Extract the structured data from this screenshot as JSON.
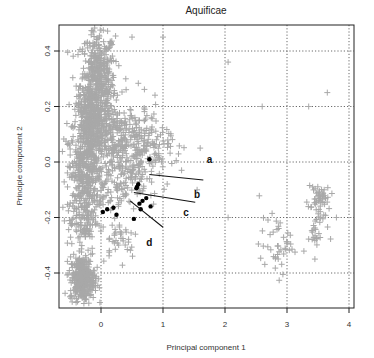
{
  "chart_data": {
    "type": "scatter",
    "title": "Aquificae",
    "xlabel": "Principal component 1",
    "ylabel": "Principle component 2",
    "xlim": [
      -0.65,
      4.05
    ],
    "ylim": [
      -0.52,
      0.5
    ],
    "xticks": [
      0,
      1,
      2,
      3,
      4
    ],
    "yticks": [
      -0.4,
      -0.2,
      0.0,
      0.2,
      0.4
    ],
    "xtick_labels": [
      "0",
      "1",
      "2",
      "3",
      "4"
    ],
    "ytick_labels": [
      "-0.4",
      "-0.2",
      "0.0",
      "0.2",
      "0.4"
    ],
    "grid": "dotted at tick positions",
    "legend": null,
    "series": [
      {
        "name": "genes (background)",
        "marker": "+",
        "color": "#a8a8a8",
        "clusters": [
          {
            "cx": -0.05,
            "cy": 0.28,
            "sx": 0.14,
            "sy": 0.1,
            "n": 500
          },
          {
            "cx": -0.2,
            "cy": 0.12,
            "sx": 0.12,
            "sy": 0.08,
            "n": 300
          },
          {
            "cx": -0.25,
            "cy": -0.05,
            "sx": 0.13,
            "sy": 0.08,
            "n": 250
          },
          {
            "cx": 0.3,
            "cy": 0.08,
            "sx": 0.35,
            "sy": 0.07,
            "n": 300
          },
          {
            "cx": 0.6,
            "cy": 0.03,
            "sx": 0.25,
            "sy": 0.06,
            "n": 150
          },
          {
            "cx": 0.15,
            "cy": -0.1,
            "sx": 0.25,
            "sy": 0.05,
            "n": 100
          },
          {
            "cx": -0.3,
            "cy": -0.2,
            "sx": 0.12,
            "sy": 0.07,
            "n": 120
          },
          {
            "cx": 0.3,
            "cy": -0.27,
            "sx": 0.15,
            "sy": 0.04,
            "n": 40
          },
          {
            "cx": -0.3,
            "cy": -0.42,
            "sx": 0.1,
            "sy": 0.04,
            "n": 350
          },
          {
            "cx": 2.85,
            "cy": -0.3,
            "sx": 0.15,
            "sy": 0.05,
            "n": 45
          },
          {
            "cx": 3.5,
            "cy": -0.15,
            "sx": 0.09,
            "sy": 0.05,
            "n": 60
          },
          {
            "cx": 3.45,
            "cy": -0.26,
            "sx": 0.05,
            "sy": 0.02,
            "n": 15
          }
        ],
        "outliers": [
          [
            0.5,
            0.45
          ],
          [
            1.0,
            0.45
          ],
          [
            0.4,
            0.3
          ],
          [
            2.05,
            0.36
          ],
          [
            3.35,
            0.2
          ],
          [
            3.65,
            0.25
          ],
          [
            2.6,
            0.2
          ],
          [
            1.3,
            -0.03
          ],
          [
            1.6,
            0.05
          ],
          [
            1.55,
            -0.1
          ],
          [
            2.05,
            -0.2
          ],
          [
            3.6,
            -0.1
          ],
          [
            3.45,
            -0.35
          ]
        ]
      },
      {
        "name": "highlighted genes",
        "marker": "filled circle",
        "color": "#000000",
        "points": [
          [
            0.78,
            0.01
          ],
          [
            0.58,
            -0.09
          ],
          [
            0.6,
            -0.08
          ],
          [
            0.57,
            -0.095
          ],
          [
            0.73,
            -0.13
          ],
          [
            0.67,
            -0.14
          ],
          [
            0.62,
            -0.15
          ],
          [
            0.8,
            -0.16
          ],
          [
            0.64,
            -0.17
          ],
          [
            0.1,
            -0.17
          ],
          [
            0.2,
            -0.165
          ],
          [
            0.03,
            -0.18
          ],
          [
            0.25,
            -0.19
          ],
          [
            0.53,
            -0.205
          ]
        ]
      }
    ],
    "annotations": [
      {
        "label": "a",
        "x": 1.75,
        "y": 0.01,
        "line": null
      },
      {
        "label": "b",
        "x": 1.55,
        "y": -0.115,
        "line": [
          [
            0.78,
            -0.045
          ],
          [
            1.65,
            -0.065
          ]
        ]
      },
      {
        "label": "c",
        "x": 1.37,
        "y": -0.18,
        "line": [
          [
            0.53,
            -0.11
          ],
          [
            1.52,
            -0.145
          ]
        ]
      },
      {
        "label": "d",
        "x": 0.78,
        "y": -0.29,
        "line": [
          [
            0.47,
            -0.14
          ],
          [
            1.0,
            -0.235
          ]
        ]
      }
    ]
  }
}
